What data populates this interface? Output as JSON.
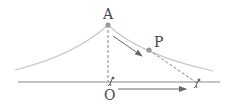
{
  "diagram": {
    "labels": {
      "point_a": "A",
      "point_p": "P",
      "point_o": "O"
    },
    "colors": {
      "curve": "#c8c8c8",
      "ground": "#8a8a8a",
      "point": "#999999",
      "dashed": "#777777",
      "arrow": "#666666",
      "text": "#444444"
    }
  }
}
